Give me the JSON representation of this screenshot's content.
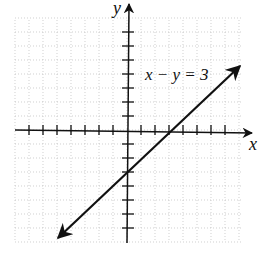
{
  "chart_data": {
    "type": "line",
    "title": "",
    "equation_label": "x − y = 3",
    "xlabel": "x",
    "ylabel": "y",
    "xlim": [
      -8,
      8
    ],
    "ylim": [
      -8,
      8
    ],
    "grid": true,
    "tick_spacing": 1,
    "series": [
      {
        "name": "x − y = 3",
        "x": [
          -5,
          8
        ],
        "y": [
          -8,
          5
        ],
        "slope": 1,
        "intercept": -3,
        "x_intercept": 3,
        "y_intercept": -3,
        "arrows_both_ends": true
      }
    ]
  },
  "labels": {
    "x_axis": "x",
    "y_axis": "y",
    "equation": "x − y = 3"
  }
}
